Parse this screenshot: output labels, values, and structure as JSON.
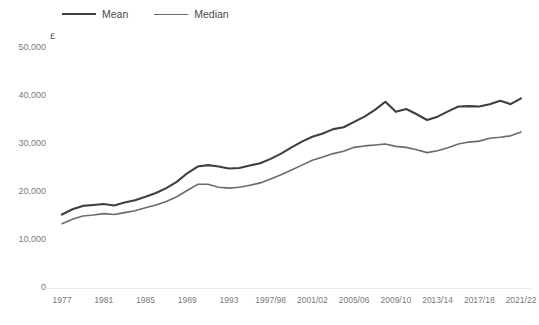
{
  "legend": {
    "position": "top-left",
    "entries": [
      {
        "label": "Mean",
        "color": "#3f3f3f",
        "icon": "line-swatch-icon"
      },
      {
        "label": "Median",
        "color": "#6b6b6b",
        "icon": "line-swatch-icon"
      }
    ]
  },
  "unit": "£",
  "axis": {
    "y_ticks": [
      "0",
      "10,000",
      "20,000",
      "30,000",
      "40,000",
      "50,000"
    ],
    "x_ticks": [
      "1977",
      "1981",
      "1985",
      "1989",
      "1993",
      "1997/98",
      "2001/02",
      "2005/06",
      "2009/10",
      "2013/14",
      "2017/18",
      "2021/22"
    ]
  },
  "chart_data": {
    "type": "line",
    "title": "",
    "subtitle": "",
    "xlabel": "",
    "ylabel": "£",
    "ylim": [
      0,
      50000
    ],
    "grid": false,
    "legend_position": "top-left",
    "x": [
      "1977",
      "1978",
      "1979",
      "1980",
      "1981",
      "1982",
      "1983",
      "1984",
      "1985",
      "1986",
      "1987",
      "1988",
      "1989",
      "1990",
      "1991",
      "1992",
      "1993",
      "1994/95",
      "1995/96",
      "1996/97",
      "1997/98",
      "1998/99",
      "1999/00",
      "2000/01",
      "2001/02",
      "2002/03",
      "2003/04",
      "2004/05",
      "2005/06",
      "2006/07",
      "2007/08",
      "2008/09",
      "2009/10",
      "2010/11",
      "2011/12",
      "2012/13",
      "2013/14",
      "2014/15",
      "2015/16",
      "2016/17",
      "2017/18",
      "2018/19",
      "2019/20",
      "2020/21",
      "2021/22"
    ],
    "x_tick_labels": [
      "1977",
      "1981",
      "1985",
      "1989",
      "1993",
      "1997/98",
      "2001/02",
      "2005/06",
      "2009/10",
      "2013/14",
      "2017/18",
      "2021/22"
    ],
    "series": [
      {
        "name": "Mean",
        "color": "#3f3f3f",
        "values": [
          15300,
          16400,
          17100,
          17300,
          17500,
          17200,
          17800,
          18300,
          19000,
          19800,
          20800,
          22100,
          23900,
          25300,
          25600,
          25300,
          24900,
          25000,
          25500,
          26000,
          26900,
          28000,
          29300,
          30500,
          31500,
          32200,
          33100,
          33500,
          34600,
          35700,
          37100,
          38800,
          36700,
          37300,
          36200,
          35000,
          35700,
          36800,
          37800,
          37900,
          37800,
          38300,
          39000,
          38300,
          39500
        ]
      },
      {
        "name": "Median",
        "color": "#6b6b6b",
        "values": [
          13400,
          14300,
          15000,
          15200,
          15500,
          15300,
          15700,
          16100,
          16700,
          17300,
          18000,
          19000,
          20300,
          21600,
          21600,
          21000,
          20800,
          21000,
          21400,
          21900,
          22700,
          23600,
          24600,
          25600,
          26600,
          27300,
          28000,
          28500,
          29300,
          29600,
          29800,
          30000,
          29500,
          29300,
          28800,
          28200,
          28600,
          29200,
          30000,
          30400,
          30600,
          31200,
          31400,
          31700,
          32500
        ]
      }
    ]
  }
}
